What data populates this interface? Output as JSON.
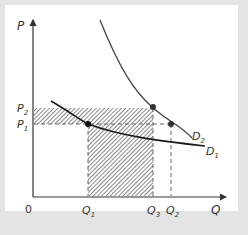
{
  "diagram": {
    "type": "supply-demand-revenue",
    "axes": {
      "y_label": "P",
      "x_label": "Q",
      "origin_label": "0"
    },
    "price_levels": [
      {
        "id": "P2",
        "label": "P",
        "sub": "2"
      },
      {
        "id": "P1",
        "label": "P",
        "sub": "1"
      }
    ],
    "quantity_levels": [
      {
        "id": "Q1",
        "label": "Q",
        "sub": "1"
      },
      {
        "id": "Q3",
        "label": "Q",
        "sub": "3"
      },
      {
        "id": "Q2",
        "label": "Q",
        "sub": "2"
      }
    ],
    "curves": [
      {
        "id": "D1",
        "label": "D",
        "sub": "1",
        "color": "#1a1a1a"
      },
      {
        "id": "D2",
        "label": "D",
        "sub": "2",
        "color": "#444444"
      }
    ],
    "points": [
      {
        "id": "P1Q1",
        "on": "D1"
      },
      {
        "id": "P2Q3",
        "on": "D2"
      },
      {
        "id": "P1Q2",
        "on": "D2"
      }
    ],
    "colors": {
      "background": "#e4e4e4",
      "panel": "#ffffff",
      "axis": "#333333",
      "hatch": "#555555",
      "dashed": "#666666"
    }
  }
}
